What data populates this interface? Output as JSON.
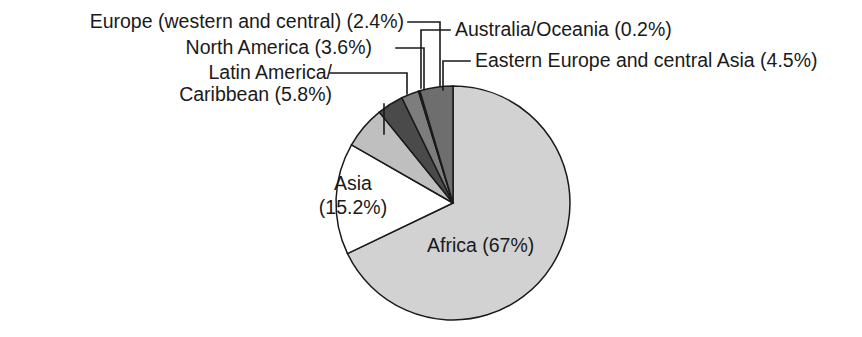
{
  "chart_data": {
    "type": "pie",
    "title": "",
    "subtitle": "",
    "xlabel": "",
    "ylabel": "",
    "legend_position": "callout-labels",
    "grid": false,
    "total_percent": 98.7,
    "units": "percent",
    "categories": [
      "Africa",
      "Asia",
      "Latin America/Caribbean",
      "North America",
      "Europe (western and central)",
      "Australia/Oceania",
      "Eastern Europe and central Asia"
    ],
    "values": [
      67,
      15.2,
      5.8,
      3.6,
      2.4,
      0.2,
      4.5
    ],
    "slices": [
      {
        "name": "Africa",
        "label": "Africa (67%)",
        "value": 67,
        "value_text": "67%",
        "color": "#d2d2d2",
        "label_placement": "inside",
        "label_x": 427,
        "label_y": 252
      },
      {
        "name": "Asia",
        "label_line1": "Asia",
        "label_line2": "(15.2%)",
        "value": 15.2,
        "value_text": "15.2%",
        "color": "#ffffff",
        "label_placement": "inside",
        "label_x": 353,
        "label_y": 190
      },
      {
        "name": "Latin America/Caribbean",
        "label_line1": "Latin America/",
        "label_line2": "Caribbean (5.8%)",
        "value": 5.8,
        "value_text": "5.8%",
        "color": "#bfbfbf",
        "label_placement": "callout-left",
        "label_x": 332,
        "label_y1": 79,
        "label_y2": 101
      },
      {
        "name": "North America",
        "label": "North America (3.6%)",
        "value": 3.6,
        "value_text": "3.6%",
        "color": "#4a4a4a",
        "label_placement": "callout-left",
        "label_x": 372,
        "label_y": 54
      },
      {
        "name": "Europe (western and central)",
        "label": "Europe (western and central) (2.4%)",
        "value": 2.4,
        "value_text": "2.4%",
        "color": "#7d7d7d",
        "label_placement": "callout-left",
        "label_x": 404,
        "label_y": 28
      },
      {
        "name": "Australia/Oceania",
        "label": "Australia/Oceania (0.2%)",
        "value": 0.2,
        "value_text": "0.2%",
        "color": "#2b2b2b",
        "label_placement": "callout-right",
        "label_x": 455,
        "label_y": 36
      },
      {
        "name": "Eastern Europe and central Asia",
        "label": "Eastern Europe and central Asia (4.5%)",
        "value": 4.5,
        "value_text": "4.5%",
        "color": "#6e6e6e",
        "label_placement": "callout-right",
        "label_x": 475,
        "label_y": 67
      }
    ],
    "geometry": {
      "center_x": 453,
      "center_y": 203,
      "radius": 117,
      "start_angle_deg": 0,
      "direction": "clockwise"
    }
  }
}
